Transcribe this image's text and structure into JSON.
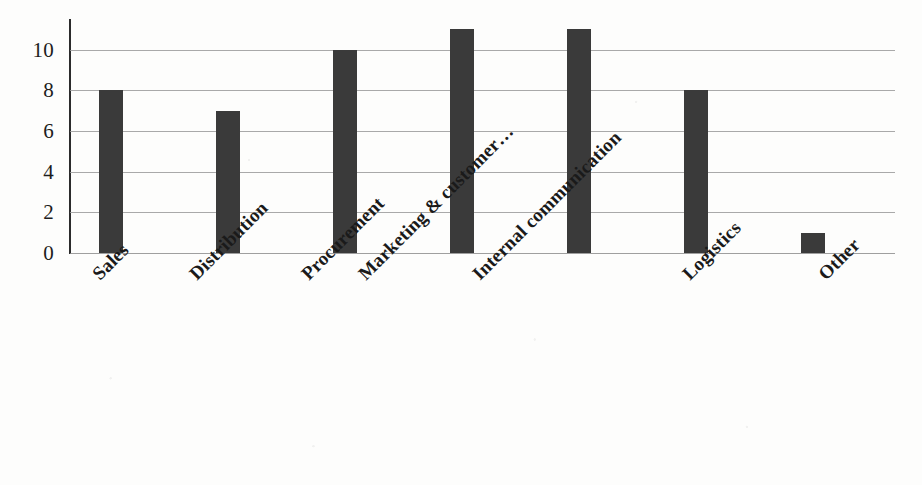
{
  "chart_data": {
    "type": "bar",
    "title": "",
    "subtitle": "",
    "xlabel": "",
    "ylabel": "",
    "categories": [
      "Sales",
      "Distribution",
      "Procurement",
      "Marketing & customer…",
      "Internal communication",
      "Logistics",
      "Other"
    ],
    "values": [
      8,
      7,
      10,
      11,
      11,
      8,
      1
    ],
    "ylim": [
      0,
      11.5
    ],
    "yticks": [
      0,
      2,
      4,
      6,
      8,
      10
    ],
    "ytick_labels": [
      "0",
      "2",
      "4",
      "6",
      "8",
      "10"
    ],
    "grid": "horizontal",
    "legend": "none",
    "bar_color": "#3a3a3a",
    "gridline_color": "#9a9a9a",
    "axis_color": "#2b2b2b",
    "background_color": "#fdfdfc",
    "tick_label_rotation": -45
  }
}
